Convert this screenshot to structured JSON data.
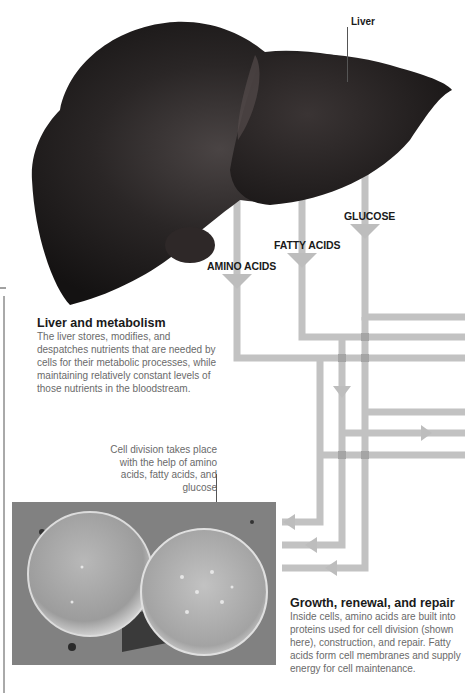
{
  "labels": {
    "liver": "Liver",
    "amino_acids": "AMINO ACIDS",
    "fatty_acids": "FATTY ACIDS",
    "glucose": "GLUCOSE"
  },
  "sections": {
    "metabolism": {
      "title": "Liver and metabolism",
      "body": "The liver stores, modifies, and despatches nutrients that are needed by cells for their metabolic processes, while maintaining relatively constant levels of those nutrients in the bloodstream."
    },
    "growth": {
      "title": "Growth, renewal, and repair",
      "body": "Inside cells, amino acids are built into proteins used for cell division (shown here), construction, and repair. Fatty acids form cell membranes and supply energy for cell maintenance."
    }
  },
  "captions": {
    "cell_division": "Cell division takes place with the help of amino acids, fatty acids, and glucose"
  },
  "images": {
    "liver": "liver-photo",
    "cells": "dividing-cells-micrograph"
  },
  "colors": {
    "pipe": "#bdbdbd",
    "pipe_overlap": "#9e9e9e",
    "liver_dark": "#1c1a1a",
    "text_dark": "#1a1a1a",
    "text_body": "#6a6a6a"
  }
}
